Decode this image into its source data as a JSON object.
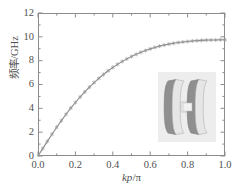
{
  "figure": {
    "background_color": "#ffffff",
    "frame_color": "#8c8c8c",
    "curve_color": "#8a8a8a",
    "marker_color": "#9a9a9a",
    "text_color": "#4f4f4f"
  },
  "axes": {
    "y_title": "频率/GHz",
    "x_title_italic": "kp",
    "x_title_rest": "/π",
    "y_ticks": [
      "0",
      "2",
      "4",
      "6",
      "8",
      "10",
      "12"
    ],
    "x_ticks": [
      "0.0",
      "0.2",
      "0.4",
      "0.6",
      "0.8",
      "1.0"
    ]
  },
  "inset": {
    "label": "unit-cell-structure",
    "background_color": "#ededed",
    "disk_face_color": "#e4e4e4",
    "disk_side_color": "#9c9c9c",
    "bar_color": "#efefef"
  },
  "chart_data": {
    "type": "line",
    "title": "",
    "subtitle": "",
    "xlabel": "kp/π",
    "ylabel": "频率/GHz",
    "xlim": [
      0.0,
      1.0
    ],
    "ylim": [
      0,
      12
    ],
    "xticks": [
      0.0,
      0.2,
      0.4,
      0.6,
      0.8,
      1.0
    ],
    "yticks": [
      0,
      2,
      4,
      6,
      8,
      10,
      12
    ],
    "grid": false,
    "legend": null,
    "legend_position": "none",
    "minor_ticks": true,
    "tick_direction": "in",
    "marker": "star",
    "series": [
      {
        "name": "dispersion",
        "color": "#8a8a8a",
        "x": [
          0.0,
          0.025,
          0.05,
          0.075,
          0.1,
          0.125,
          0.15,
          0.175,
          0.2,
          0.225,
          0.25,
          0.275,
          0.3,
          0.325,
          0.35,
          0.375,
          0.4,
          0.425,
          0.45,
          0.475,
          0.5,
          0.525,
          0.55,
          0.575,
          0.6,
          0.625,
          0.65,
          0.675,
          0.7,
          0.725,
          0.75,
          0.775,
          0.8,
          0.825,
          0.85,
          0.875,
          0.9,
          0.925,
          0.95,
          0.975,
          1.0
        ],
        "y": [
          0.0,
          0.62,
          1.23,
          1.83,
          2.41,
          2.97,
          3.5,
          4.01,
          4.49,
          4.95,
          5.38,
          5.78,
          6.16,
          6.51,
          6.84,
          7.15,
          7.43,
          7.69,
          7.93,
          8.15,
          8.35,
          8.53,
          8.7,
          8.85,
          8.99,
          9.11,
          9.22,
          9.31,
          9.39,
          9.46,
          9.52,
          9.57,
          9.61,
          9.65,
          9.68,
          9.7,
          9.72,
          9.73,
          9.74,
          9.75,
          9.75
        ]
      }
    ]
  }
}
